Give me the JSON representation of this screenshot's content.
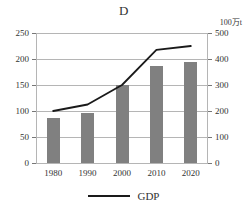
{
  "chart_data": {
    "type": "bar",
    "title": "D",
    "xlabel": "",
    "ylabel": "",
    "grid": true,
    "legend_position": "bottom",
    "categories": [
      "1980",
      "1990",
      "2000",
      "2010",
      "2020"
    ],
    "left_axis": {
      "ylim": [
        0,
        250
      ],
      "ticks": [
        0,
        50,
        100,
        150,
        200,
        250
      ],
      "tick_labels": [
        "0",
        "50",
        "100",
        "150",
        "200",
        "250"
      ],
      "unit": ""
    },
    "right_axis": {
      "ylim": [
        0,
        500
      ],
      "ticks": [
        0,
        100,
        200,
        300,
        400,
        500
      ],
      "tick_labels": [
        "0",
        "100",
        "200",
        "300",
        "400",
        "500"
      ],
      "unit": "100万t"
    },
    "series": [
      {
        "name": "bars",
        "type": "bar",
        "axis": "left",
        "color": "#808080",
        "values": [
          87,
          97,
          150,
          187,
          194
        ]
      },
      {
        "name": "GDP",
        "type": "line",
        "axis": "right",
        "color": "#1a1a1a",
        "values": [
          200,
          225,
          300,
          435,
          450
        ]
      }
    ]
  },
  "legend": {
    "entries": [
      {
        "label": "GDP",
        "color": "#1a1a1a",
        "marker": "line"
      }
    ]
  }
}
